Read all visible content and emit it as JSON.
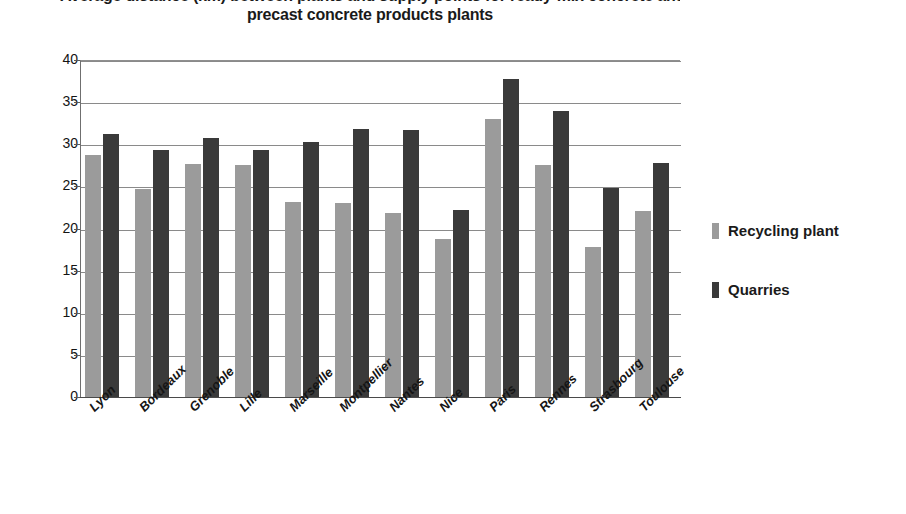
{
  "chart_data": {
    "type": "bar",
    "title": "precast concrete products plants",
    "title_line_1": "Average distance (km) between plants and supply points for ready-mix concrete and",
    "title_line_2": "precast concrete products plants",
    "xlabel": "",
    "ylabel": "",
    "ylim": [
      0,
      40
    ],
    "ytick_step": 5,
    "yticks": [
      "0",
      "5",
      "10",
      "15",
      "20",
      "25",
      "30",
      "35",
      "40"
    ],
    "grid": true,
    "legend_position": "right",
    "categories": [
      "Lyon",
      "Bordeaux",
      "Grenoble",
      "Lille",
      "Marseille",
      "Montpellier",
      "Nantes",
      "Nice",
      "Paris",
      "Rennes",
      "Strasbourg",
      "Toulouse"
    ],
    "series": [
      {
        "name": "Recycling plant",
        "color": "#9b9b9b",
        "values": [
          28.7,
          24.7,
          27.7,
          27.5,
          23.2,
          23.0,
          21.9,
          18.7,
          33.0,
          27.5,
          17.8,
          22.1
        ]
      },
      {
        "name": "Quarries",
        "color": "#3a3a3a",
        "values": [
          31.2,
          29.3,
          30.7,
          29.3,
          30.3,
          31.8,
          31.7,
          22.2,
          37.7,
          33.9,
          24.8,
          27.8
        ]
      }
    ]
  },
  "legend": {
    "entries": [
      {
        "label": "Recycling plant",
        "swatch": "light"
      },
      {
        "label": "Quarries",
        "swatch": "dark"
      }
    ]
  },
  "colors": {
    "recycling_plant": "#9b9b9b",
    "quarries": "#3a3a3a",
    "gridline": "#8a8a8a",
    "axis": "#4a4a4a",
    "background": "#ffffff",
    "text": "#1a1a1a"
  }
}
